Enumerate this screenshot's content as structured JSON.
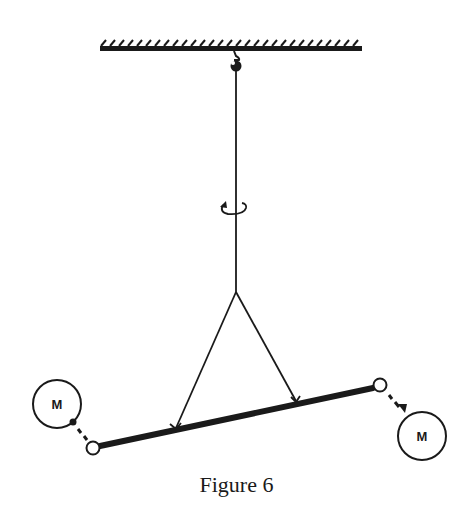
{
  "figure": {
    "caption": "Figure 6",
    "ink_color": "#1a1a1a",
    "background": "#ffffff",
    "ceiling": {
      "label": "fixed support (hatched ceiling)"
    },
    "hook": {
      "label": "hook"
    },
    "wire": {
      "label": "torsion wire"
    },
    "rotation_indicator": {
      "label": "rotation arrow"
    },
    "suspension": {
      "label": "V-shaped suspension strings"
    },
    "bar": {
      "label": "rod with small end spheres"
    },
    "masses": [
      {
        "label": "M",
        "side": "left"
      },
      {
        "label": "M",
        "side": "right"
      }
    ]
  }
}
